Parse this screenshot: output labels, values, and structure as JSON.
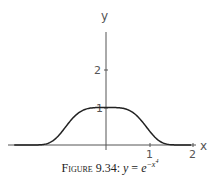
{
  "chart_data": {
    "type": "line",
    "title": "",
    "xlabel": "x",
    "ylabel": "y",
    "xticks": [
      "1",
      "2"
    ],
    "yticks": [
      "1",
      "2"
    ],
    "xlim": [
      -2.1,
      2.1
    ],
    "ylim": [
      0,
      3
    ],
    "grid": false,
    "function": "y = exp(-x^4)",
    "series": [
      {
        "name": "y = e^{-x^4}",
        "x": [
          -2.0,
          -1.5,
          -1.25,
          -1.0,
          -0.75,
          -0.5,
          -0.25,
          0,
          0.25,
          0.5,
          0.75,
          1.0,
          1.25,
          1.5,
          2.0
        ],
        "y": [
          0.0,
          0.006,
          0.087,
          0.368,
          0.729,
          0.939,
          0.996,
          1.0,
          0.996,
          0.939,
          0.729,
          0.368,
          0.087,
          0.006,
          0.0
        ]
      }
    ]
  },
  "caption": {
    "prefix": "Figure 9.34:",
    "y": "y",
    "eq": " = ",
    "e": "e",
    "exp": "−x",
    "pow": "4"
  },
  "axes": {
    "x_label": "x",
    "y_label": "y",
    "x_tick_1": "1",
    "x_tick_2": "2",
    "y_tick_1": "1",
    "y_tick_2": "2"
  }
}
